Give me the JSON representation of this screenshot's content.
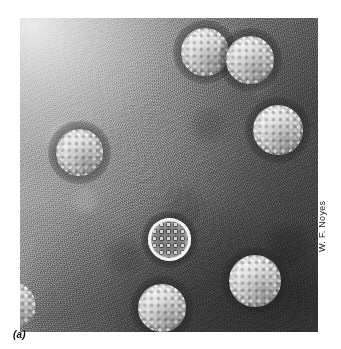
{
  "figure": {
    "panel_label": "(a)",
    "photo_credit": "W. F. Noyes",
    "plate": {
      "background_light_hex": "#d8d8d8",
      "background_dark_hex": "#565656",
      "particle_highlight_hex": "#fbfbfb",
      "stain_halo_hex": "#141414"
    },
    "particles": [
      {
        "name": "virion-top-left",
        "cx": 185,
        "cy": 34,
        "d": 48,
        "state": "intact"
      },
      {
        "name": "virion-top-right",
        "cx": 230,
        "cy": 42,
        "d": 48,
        "state": "intact"
      },
      {
        "name": "virion-left",
        "cx": 59,
        "cy": 134,
        "d": 47,
        "state": "intact"
      },
      {
        "name": "virion-right",
        "cx": 258,
        "cy": 112,
        "d": 50,
        "state": "intact"
      },
      {
        "name": "virion-center-empty",
        "cx": 150,
        "cy": 222,
        "d": 43,
        "state": "penetrated"
      },
      {
        "name": "virion-bottom-right",
        "cx": 235,
        "cy": 263,
        "d": 52,
        "state": "intact"
      },
      {
        "name": "virion-bottom-center",
        "cx": 142,
        "cy": 290,
        "d": 48,
        "state": "intact"
      },
      {
        "name": "virion-bottom-left-clipped",
        "cx": -8,
        "cy": 288,
        "d": 48,
        "state": "intact-clipped"
      }
    ]
  }
}
